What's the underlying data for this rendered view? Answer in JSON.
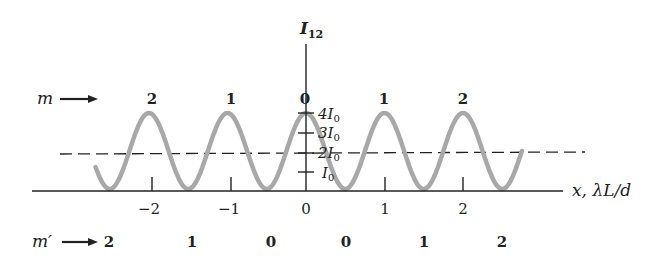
{
  "chart_data": {
    "type": "line",
    "xlabel": "x, λL/d",
    "ylabel": "I12",
    "x_ticks": [
      -2,
      -1,
      0,
      1,
      2
    ],
    "x_tick_labels": [
      "−2",
      "−1",
      "0",
      "1",
      "2"
    ],
    "y_ticks": [
      "I0",
      "2I0",
      "3I0",
      "4I0"
    ],
    "y_tick_values": [
      1,
      2,
      3,
      4
    ],
    "xlim": [
      -2.7,
      2.7
    ],
    "ylim": [
      0,
      4
    ],
    "grid": false,
    "series": [
      {
        "name": "I12 = 4I0 cos^2(pi x d / (lambda L))",
        "style": "thick gray solid",
        "function": "4*cos^2(pi*x)",
        "x": [
          -2.65,
          -2.5,
          -2.0,
          -1.5,
          -1.0,
          -0.5,
          0.0,
          0.5,
          1.0,
          1.5,
          2.0,
          2.5,
          2.75
        ],
        "y": [
          1.8,
          0,
          4,
          0,
          4,
          0,
          4,
          0,
          4,
          0,
          4,
          0,
          2.0
        ]
      },
      {
        "name": "average intensity 2I0",
        "style": "dashed black",
        "x": [
          -2.7,
          3.25
        ],
        "y": [
          2,
          2
        ]
      }
    ],
    "annotations": {
      "m_label": "m",
      "m_values": [
        {
          "x": -2,
          "label": "2"
        },
        {
          "x": -1,
          "label": "1"
        },
        {
          "x": 0,
          "label": "0"
        },
        {
          "x": 1,
          "label": "1"
        },
        {
          "x": 2,
          "label": "2"
        }
      ],
      "m_prime_label": "m′",
      "m_prime_values": [
        {
          "x": -2.5,
          "label": "2"
        },
        {
          "x": -1.5,
          "label": "1"
        },
        {
          "x": -0.5,
          "label": "0"
        },
        {
          "x": 0.5,
          "label": "0"
        },
        {
          "x": 1.5,
          "label": "1"
        },
        {
          "x": 2.5,
          "label": "2"
        }
      ]
    }
  },
  "labels": {
    "y_axis_main": "I",
    "y_axis_sub": "12",
    "x_axis": "x, λL/d",
    "m": "m",
    "m_prime": "m′",
    "y_tick_I0": "I",
    "y_tick_2": "2I",
    "y_tick_3": "3I",
    "y_tick_4": "4I",
    "sub0": "0",
    "x_tick_m2": "−2",
    "x_tick_m1": "−1",
    "x_tick_0": "0",
    "x_tick_1": "1",
    "x_tick_2": "2",
    "m_top": [
      "2",
      "1",
      "0",
      "1",
      "2"
    ],
    "m_bottom": [
      "2",
      "1",
      "0",
      "0",
      "1",
      "2"
    ]
  }
}
